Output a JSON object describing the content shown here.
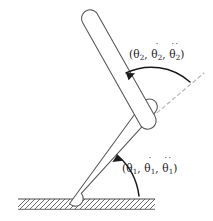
{
  "figure": {
    "width": 213,
    "height": 221,
    "background_color": "#ffffff",
    "line_color": "#5a5a5a",
    "annotation_color": "#1a1a1a",
    "dashed_axis_color": "#b0b0b0"
  },
  "annotations": [
    {
      "id": "theta2",
      "text": "(θ₂, θ̇₂, θ̈₂)",
      "open_paren": "(",
      "close_paren": ")",
      "comma": ",",
      "symbol": "θ",
      "subscript": "2",
      "terms": [
        {
          "symbol": "θ",
          "subscript": "2",
          "dots": ""
        },
        {
          "symbol": "θ",
          "subscript": "2",
          "dots": "˙"
        },
        {
          "symbol": "θ",
          "subscript": "2",
          "dots": "˙˙"
        }
      ]
    },
    {
      "id": "theta1",
      "text": "(θ₁, θ̇₁, θ̈₁)",
      "open_paren": "(",
      "close_paren": ")",
      "comma": ",",
      "symbol": "θ",
      "subscript": "1",
      "terms": [
        {
          "symbol": "θ",
          "subscript": "1",
          "dots": ""
        },
        {
          "symbol": "θ",
          "subscript": "1",
          "dots": "˙"
        },
        {
          "symbol": "θ",
          "subscript": "1",
          "dots": "˙˙"
        }
      ]
    }
  ],
  "geometry": {
    "ground": {
      "line_y": 199,
      "x_start": 18,
      "x_end": 155,
      "hatch_depth": 10,
      "hatch_count": 28
    },
    "lower_link": {
      "base_point": [
        76,
        201
      ],
      "joint_point": [
        150,
        119
      ],
      "half_width": 7.5
    },
    "upper_link": {
      "joint_point": [
        148,
        116
      ],
      "tip_point": [
        89,
        19
      ],
      "half_width": 8.5
    },
    "dashed_axis": {
      "from": [
        152,
        116
      ],
      "to": [
        203,
        73
      ]
    },
    "arc_theta1": {
      "center": [
        76,
        201
      ],
      "radius": 62,
      "start_deg": 0,
      "end_deg": 48
    },
    "arc_theta2": {
      "center": [
        150,
        118
      ],
      "radius": 57,
      "start_deg": 40,
      "end_deg": 120
    }
  }
}
